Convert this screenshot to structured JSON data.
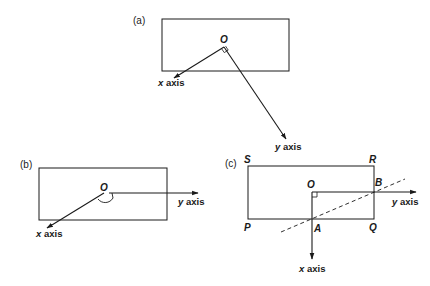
{
  "diagram": {
    "panels": [
      {
        "id": "a",
        "label": "(a)",
        "origin_label": "O",
        "x_axis_var": "x",
        "x_axis_word": " axis",
        "y_axis_var": "y",
        "y_axis_word": " axis",
        "angle_marker": "right-angle"
      },
      {
        "id": "b",
        "label": "(b)",
        "origin_label": "O",
        "x_axis_var": "x",
        "x_axis_word": " axis",
        "y_axis_var": "y",
        "y_axis_word": " axis",
        "angle_marker": "obtuse-arc"
      },
      {
        "id": "c",
        "label": "(c)",
        "origin_label": "O",
        "x_axis_var": "x",
        "x_axis_word": " axis",
        "y_axis_var": "y",
        "y_axis_word": " axis",
        "angle_marker": "right-angle",
        "corners": {
          "P": "P",
          "Q": "Q",
          "R": "R",
          "S": "S"
        },
        "points": {
          "A": "A",
          "B": "B"
        },
        "dashed_line": "through A and B"
      }
    ]
  },
  "colors": {
    "ink": "#1a1a1a",
    "background": "#ffffff"
  }
}
